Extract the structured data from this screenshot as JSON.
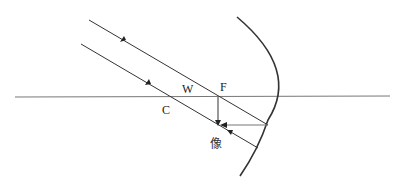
{
  "diagram": {
    "title": "",
    "type": "concave mirror ray diagram",
    "labels": {
      "W": "W",
      "F": "F",
      "C": "C",
      "image": "像"
    },
    "colors": {
      "line": "#333333",
      "axis": "#777777",
      "background": "#ffffff"
    }
  }
}
